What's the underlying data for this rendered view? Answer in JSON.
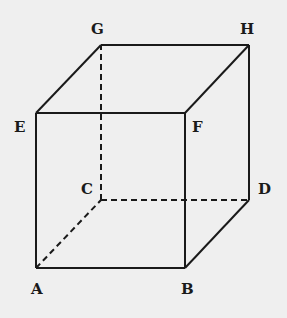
{
  "diagram": {
    "type": "cube-3d-perspective",
    "background": "#efefef",
    "stroke": "#1a1a1a",
    "vertices": {
      "A": {
        "label": "A",
        "x": 36,
        "y": 268
      },
      "B": {
        "label": "B",
        "x": 185,
        "y": 268
      },
      "C": {
        "label": "C",
        "x": 101,
        "y": 200
      },
      "D": {
        "label": "D",
        "x": 249,
        "y": 200
      },
      "E": {
        "label": "E",
        "x": 36,
        "y": 113
      },
      "F": {
        "label": "F",
        "x": 185,
        "y": 113
      },
      "G": {
        "label": "G",
        "x": 101,
        "y": 45
      },
      "H": {
        "label": "H",
        "x": 249,
        "y": 45
      }
    },
    "solid_edges": [
      "AB",
      "AE",
      "BF",
      "BD",
      "EF",
      "EG",
      "FH",
      "GH",
      "HD"
    ],
    "hidden_edges": [
      "AC",
      "CD",
      "CG"
    ]
  }
}
